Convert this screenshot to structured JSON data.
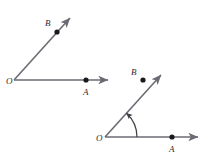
{
  "figure": {
    "background_color": "#ffffff",
    "line_color": "#6b6b73",
    "point_color": "#1a1a1e",
    "label_color": "#2b2b2f",
    "arc_color": "#3f3f46"
  },
  "diagrams": [
    {
      "id": "left-angle",
      "name": "angle-AOB-plain",
      "has_arc": false,
      "vertex": {
        "label": "O",
        "x": 14,
        "y": 80,
        "label_x": 7,
        "label_y": 84
      },
      "ray_horizontal": {
        "name": "ray-OA",
        "from_x": 14,
        "from_y": 80,
        "to_x": 110,
        "to_y": 80,
        "point": {
          "label": "A",
          "x": 86,
          "y": 80,
          "label_x": 83,
          "label_y": 95
        }
      },
      "ray_diagonal": {
        "name": "ray-OB",
        "from_x": 14,
        "from_y": 80,
        "to_x": 72,
        "to_y": 16,
        "point": {
          "label": "B",
          "x": 57,
          "y": 32,
          "label_x": 46,
          "label_y": 25
        }
      }
    },
    {
      "id": "right-angle",
      "name": "angle-AOB-with-rotation-arc",
      "has_arc": true,
      "vertex": {
        "label": "O",
        "x": 105,
        "y": 137,
        "label_x": 97,
        "label_y": 141
      },
      "ray_horizontal": {
        "name": "ray-OA",
        "from_x": 105,
        "from_y": 137,
        "to_x": 200,
        "to_y": 137,
        "point": {
          "label": "A",
          "x": 172,
          "y": 137,
          "label_x": 169,
          "label_y": 152
        }
      },
      "ray_diagonal": {
        "name": "ray-OB",
        "from_x": 105,
        "from_y": 137,
        "to_x": 163,
        "to_y": 73,
        "point": {
          "label": "B",
          "x": 143,
          "y": 80,
          "label_x": 132,
          "label_y": 74
        }
      },
      "arc": {
        "name": "rotation-arc",
        "radius": 32,
        "start_angle_deg": 0,
        "end_angle_deg": 48,
        "direction": "counterclockwise",
        "arrow_at": "end"
      }
    }
  ],
  "labels": {
    "vertex": "O",
    "point_a": "A",
    "point_b": "B"
  }
}
